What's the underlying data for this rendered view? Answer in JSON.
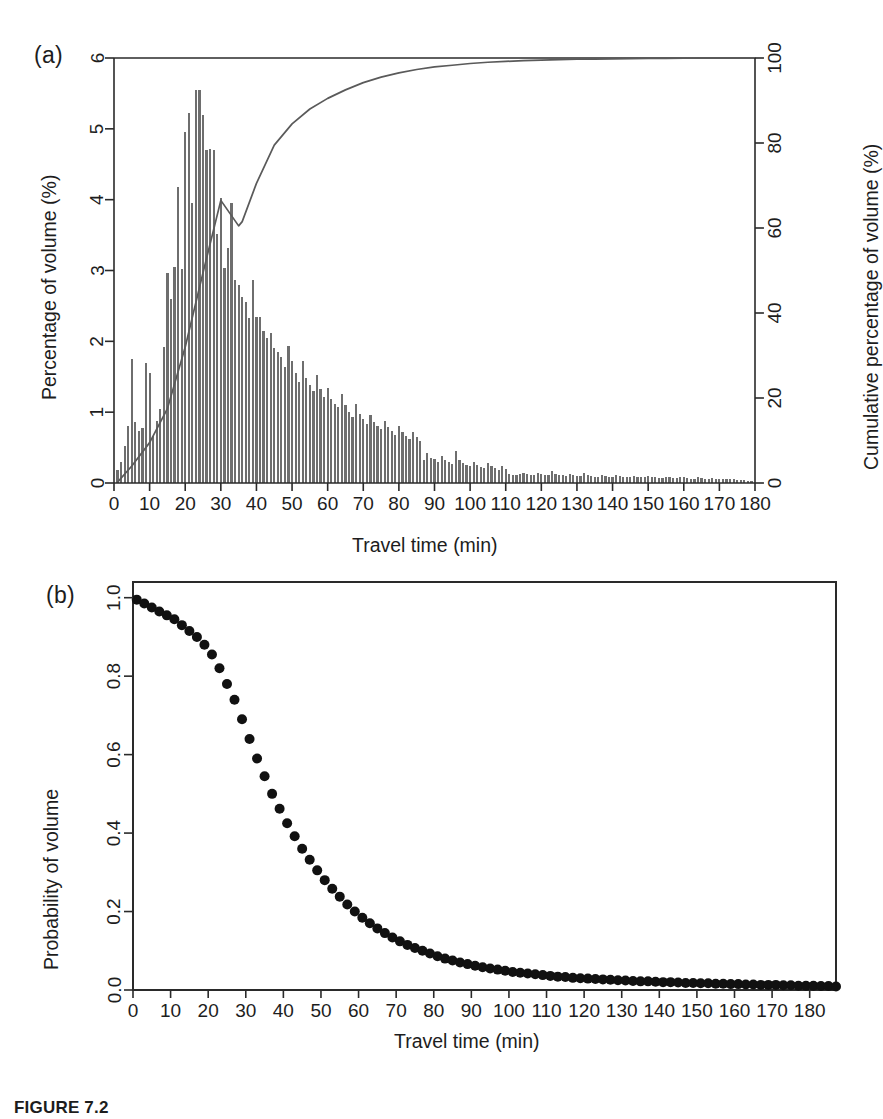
{
  "figure": {
    "caption": "FIGURE 7.2",
    "panel_a_tag": "(a)",
    "panel_b_tag": "(b)"
  },
  "panel_a": {
    "left_axis_title": "Percentage of volume (%)",
    "right_axis_title": "Cumulative percentage of volume (%)",
    "x_axis_title": "Travel time (min)",
    "bar_color": "#6e6e6e",
    "curve_color": "#5a5a5a",
    "axis_color": "#2a2a2a"
  },
  "panel_b": {
    "y_axis_title": "Probability of volume",
    "x_axis_title": "Travel time (min)",
    "point_color": "#111111",
    "axis_color": "#2a2a2a"
  },
  "chart_data": [
    {
      "type": "bar",
      "id": "panel-a-histogram",
      "title": "",
      "xlabel": "Travel time (min)",
      "ylabel": "Percentage of volume (%)",
      "y2label": "Cumulative percentage of volume (%)",
      "xlim": [
        0,
        180
      ],
      "ylim": [
        0,
        6
      ],
      "y2lim": [
        0,
        100
      ],
      "xticks": [
        0,
        10,
        20,
        30,
        40,
        50,
        60,
        70,
        80,
        90,
        100,
        110,
        120,
        130,
        140,
        150,
        160,
        170,
        180
      ],
      "yticks": [
        0,
        1,
        2,
        3,
        4,
        5,
        6
      ],
      "y2ticks": [
        0,
        20,
        40,
        60,
        80,
        100
      ],
      "grid": false,
      "legend": "none",
      "x": [
        1,
        2,
        3,
        4,
        5,
        6,
        7,
        8,
        9,
        10,
        11,
        12,
        13,
        14,
        15,
        16,
        17,
        18,
        19,
        20,
        21,
        22,
        23,
        24,
        25,
        26,
        27,
        28,
        29,
        30,
        31,
        32,
        33,
        34,
        35,
        36,
        37,
        38,
        39,
        40,
        41,
        42,
        43,
        44,
        45,
        46,
        47,
        48,
        49,
        50,
        51,
        52,
        53,
        54,
        55,
        56,
        57,
        58,
        59,
        60,
        61,
        62,
        63,
        64,
        65,
        66,
        67,
        68,
        69,
        70,
        71,
        72,
        73,
        74,
        75,
        76,
        77,
        78,
        79,
        80,
        81,
        82,
        83,
        84,
        85,
        86,
        87,
        88,
        89,
        90,
        91,
        92,
        93,
        94,
        95,
        96,
        97,
        98,
        99,
        100,
        101,
        102,
        103,
        104,
        105,
        106,
        107,
        108,
        109,
        110,
        111,
        112,
        113,
        114,
        115,
        116,
        117,
        118,
        119,
        120,
        121,
        122,
        123,
        124,
        125,
        126,
        127,
        128,
        129,
        130,
        131,
        132,
        133,
        134,
        135,
        136,
        137,
        138,
        139,
        140,
        141,
        142,
        143,
        144,
        145,
        146,
        147,
        148,
        149,
        150,
        151,
        152,
        153,
        154,
        155,
        156,
        157,
        158,
        159,
        160,
        161,
        162,
        163,
        164,
        165,
        166,
        167,
        168,
        169,
        170,
        171,
        172,
        173,
        174,
        175,
        176,
        177,
        178,
        179,
        180
      ],
      "values": [
        0.18,
        0.3,
        0.52,
        0.8,
        1.75,
        0.86,
        0.74,
        0.78,
        1.7,
        1.55,
        0.66,
        0.88,
        1.05,
        1.92,
        2.97,
        2.6,
        3.05,
        4.18,
        3.02,
        4.95,
        5.22,
        3.95,
        5.55,
        5.55,
        5.2,
        4.7,
        4.72,
        4.7,
        3.52,
        4.02,
        3.03,
        3.32,
        3.95,
        2.87,
        2.8,
        2.62,
        2.55,
        2.33,
        2.86,
        2.35,
        2.34,
        2.15,
        2.05,
        2.12,
        1.9,
        1.85,
        1.78,
        1.64,
        1.93,
        1.72,
        1.55,
        1.42,
        1.72,
        1.48,
        1.38,
        1.3,
        1.52,
        1.33,
        1.22,
        1.34,
        1.18,
        1.12,
        1.07,
        1.25,
        1.1,
        1.0,
        0.93,
        1.12,
        0.98,
        0.91,
        0.84,
        0.96,
        0.86,
        0.8,
        0.76,
        0.88,
        0.79,
        0.73,
        0.68,
        0.8,
        0.72,
        0.67,
        0.62,
        0.72,
        0.65,
        0.6,
        0.33,
        0.42,
        0.36,
        0.34,
        0.3,
        0.38,
        0.33,
        0.3,
        0.27,
        0.45,
        0.33,
        0.28,
        0.25,
        0.24,
        0.3,
        0.26,
        0.23,
        0.21,
        0.28,
        0.24,
        0.21,
        0.19,
        0.24,
        0.2,
        0.13,
        0.12,
        0.12,
        0.13,
        0.14,
        0.13,
        0.12,
        0.12,
        0.14,
        0.13,
        0.12,
        0.11,
        0.17,
        0.13,
        0.12,
        0.11,
        0.1,
        0.13,
        0.12,
        0.1,
        0.1,
        0.14,
        0.12,
        0.1,
        0.09,
        0.09,
        0.11,
        0.1,
        0.09,
        0.09,
        0.12,
        0.1,
        0.09,
        0.08,
        0.08,
        0.1,
        0.09,
        0.08,
        0.08,
        0.1,
        0.09,
        0.08,
        0.07,
        0.07,
        0.09,
        0.08,
        0.07,
        0.07,
        0.09,
        0.08,
        0.07,
        0.06,
        0.06,
        0.08,
        0.07,
        0.06,
        0.06,
        0.07,
        0.06,
        0.05,
        0.05,
        0.05,
        0.06,
        0.05,
        0.04,
        0.04,
        0.04,
        0.03,
        0.03
      ],
      "cumulative_series": {
        "name": "Cumulative percentage of volume",
        "x": [
          1,
          5,
          10,
          15,
          20,
          25,
          30,
          35,
          36,
          40,
          45,
          50,
          55,
          60,
          65,
          70,
          75,
          80,
          85,
          90,
          95,
          100,
          105,
          110,
          115,
          120,
          125,
          130,
          135,
          140,
          145,
          150,
          155,
          160,
          165,
          170,
          175,
          180
        ],
        "values": [
          0.2,
          4.0,
          9.5,
          17.5,
          32.0,
          49.5,
          66.5,
          60.5,
          61.5,
          70.5,
          79.5,
          84.5,
          88.0,
          90.5,
          92.5,
          94.2,
          95.5,
          96.5,
          97.3,
          97.9,
          98.3,
          98.7,
          99.0,
          99.2,
          99.4,
          99.5,
          99.6,
          99.7,
          99.75,
          99.8,
          99.85,
          99.9,
          99.92,
          99.94,
          99.96,
          99.97,
          99.98,
          100.0
        ]
      }
    },
    {
      "type": "scatter",
      "id": "panel-b-probability",
      "title": "",
      "xlabel": "Travel time (min)",
      "ylabel": "Probability of volume",
      "xlim": [
        0,
        187
      ],
      "ylim": [
        0,
        1.04
      ],
      "xticks": [
        0,
        10,
        20,
        30,
        40,
        50,
        60,
        70,
        80,
        90,
        100,
        110,
        120,
        130,
        140,
        150,
        160,
        170,
        180
      ],
      "yticks": [
        0.0,
        0.2,
        0.4,
        0.6,
        0.8,
        1.0
      ],
      "ytick_labels": [
        "0.0",
        "0.2",
        "0.4",
        "0.6",
        "0.8",
        "1.0"
      ],
      "grid": false,
      "legend": "none",
      "x": [
        1,
        3,
        5,
        7,
        9,
        11,
        13,
        15,
        17,
        19,
        21,
        23,
        25,
        27,
        29,
        31,
        33,
        35,
        37,
        39,
        41,
        43,
        45,
        47,
        49,
        51,
        53,
        55,
        57,
        59,
        61,
        63,
        65,
        67,
        69,
        71,
        73,
        75,
        77,
        79,
        81,
        83,
        85,
        87,
        89,
        91,
        93,
        95,
        97,
        99,
        101,
        103,
        105,
        107,
        109,
        111,
        113,
        115,
        117,
        119,
        121,
        123,
        125,
        127,
        129,
        131,
        133,
        135,
        137,
        139,
        141,
        143,
        145,
        147,
        149,
        151,
        153,
        155,
        157,
        159,
        161,
        163,
        165,
        167,
        169,
        171,
        173,
        175,
        177,
        179,
        181,
        183,
        185,
        187
      ],
      "values": [
        0.995,
        0.985,
        0.975,
        0.965,
        0.955,
        0.945,
        0.93,
        0.915,
        0.9,
        0.88,
        0.855,
        0.82,
        0.78,
        0.74,
        0.69,
        0.64,
        0.59,
        0.545,
        0.5,
        0.462,
        0.425,
        0.392,
        0.36,
        0.332,
        0.305,
        0.28,
        0.258,
        0.238,
        0.218,
        0.2,
        0.184,
        0.17,
        0.157,
        0.145,
        0.134,
        0.124,
        0.115,
        0.107,
        0.1,
        0.093,
        0.086,
        0.08,
        0.075,
        0.07,
        0.066,
        0.062,
        0.058,
        0.055,
        0.052,
        0.049,
        0.046,
        0.044,
        0.042,
        0.04,
        0.038,
        0.036,
        0.034,
        0.033,
        0.031,
        0.03,
        0.029,
        0.028,
        0.027,
        0.026,
        0.025,
        0.024,
        0.023,
        0.022,
        0.022,
        0.021,
        0.02,
        0.02,
        0.019,
        0.018,
        0.018,
        0.017,
        0.017,
        0.016,
        0.016,
        0.015,
        0.015,
        0.014,
        0.014,
        0.013,
        0.013,
        0.013,
        0.012,
        0.012,
        0.011,
        0.011,
        0.011,
        0.01,
        0.01,
        0.009
      ]
    }
  ]
}
